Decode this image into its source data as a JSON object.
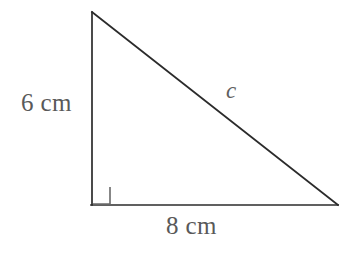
{
  "figure": {
    "type": "right-triangle-diagram",
    "background_color": "#ffffff",
    "stroke_color": "#2b2b2b",
    "text_color": "#595959",
    "width": 359,
    "height": 260,
    "vertices": {
      "apex": [
        92,
        12
      ],
      "right_angle": [
        92,
        205
      ],
      "base_right": [
        338,
        205
      ]
    },
    "right_angle_marker": {
      "shown": true,
      "size": 18,
      "position": [
        92,
        205
      ]
    },
    "labels": {
      "leg_vertical": "6 cm",
      "leg_horizontal": "8 cm",
      "hypotenuse": "c"
    },
    "measurements": {
      "leg_vertical_value": 6,
      "leg_horizontal_value": 8,
      "hypotenuse_value": "c",
      "units": "cm"
    }
  }
}
